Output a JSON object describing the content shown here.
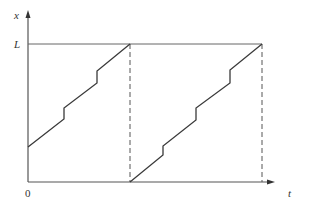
{
  "diagram": {
    "type": "sawtooth-position-time",
    "labels": {
      "y_axis": "x",
      "x_axis": "t",
      "origin": "0",
      "level": "L"
    },
    "colors": {
      "line": "#3a3a3a",
      "axis": "#555555",
      "guide": "#666666",
      "background": "#ffffff"
    },
    "geometry": {
      "origin": [
        28,
        182
      ],
      "y_axis_top": 12,
      "x_axis_right": 272,
      "level_y": 44,
      "level_x_end": 262,
      "dashed_x": [
        130,
        262
      ]
    },
    "curves": [
      {
        "name": "segment-1",
        "points": [
          [
            28,
            147
          ],
          [
            64,
            119
          ],
          [
            64,
            108
          ],
          [
            97,
            83
          ],
          [
            97,
            71
          ],
          [
            130,
            44
          ]
        ]
      },
      {
        "name": "segment-2",
        "points": [
          [
            130,
            182
          ],
          [
            163,
            155
          ],
          [
            163,
            146
          ],
          [
            196,
            120
          ],
          [
            196,
            108
          ],
          [
            230,
            83
          ],
          [
            230,
            70
          ],
          [
            262,
            44
          ]
        ]
      }
    ]
  }
}
